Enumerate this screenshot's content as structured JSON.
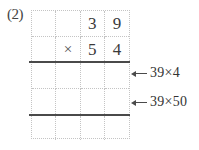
{
  "problem_label": "(2)",
  "colors": {
    "background": "#ffffff",
    "digit_text": "#3a3a3a",
    "grid_dotted_line": "#c4c4c4",
    "solid_rule_line": "#4a4a4a",
    "annotation_text": "#333333"
  },
  "grid": {
    "columns": 4,
    "rows": [
      {
        "cells": [
          "",
          "",
          "3",
          "9"
        ]
      },
      {
        "cells": [
          "",
          "×",
          "5",
          "4"
        ]
      },
      {
        "cells": [
          "",
          "",
          "",
          ""
        ]
      },
      {
        "cells": [
          "",
          "",
          "",
          ""
        ]
      },
      {
        "cells": [
          "",
          "",
          "",
          ""
        ]
      }
    ]
  },
  "annotations": [
    {
      "label": "39×4",
      "icon": "left-arrow-icon",
      "points_to": "partial-product-row-1"
    },
    {
      "label": "39×50",
      "icon": "left-arrow-icon",
      "points_to": "partial-product-row-2"
    }
  ]
}
